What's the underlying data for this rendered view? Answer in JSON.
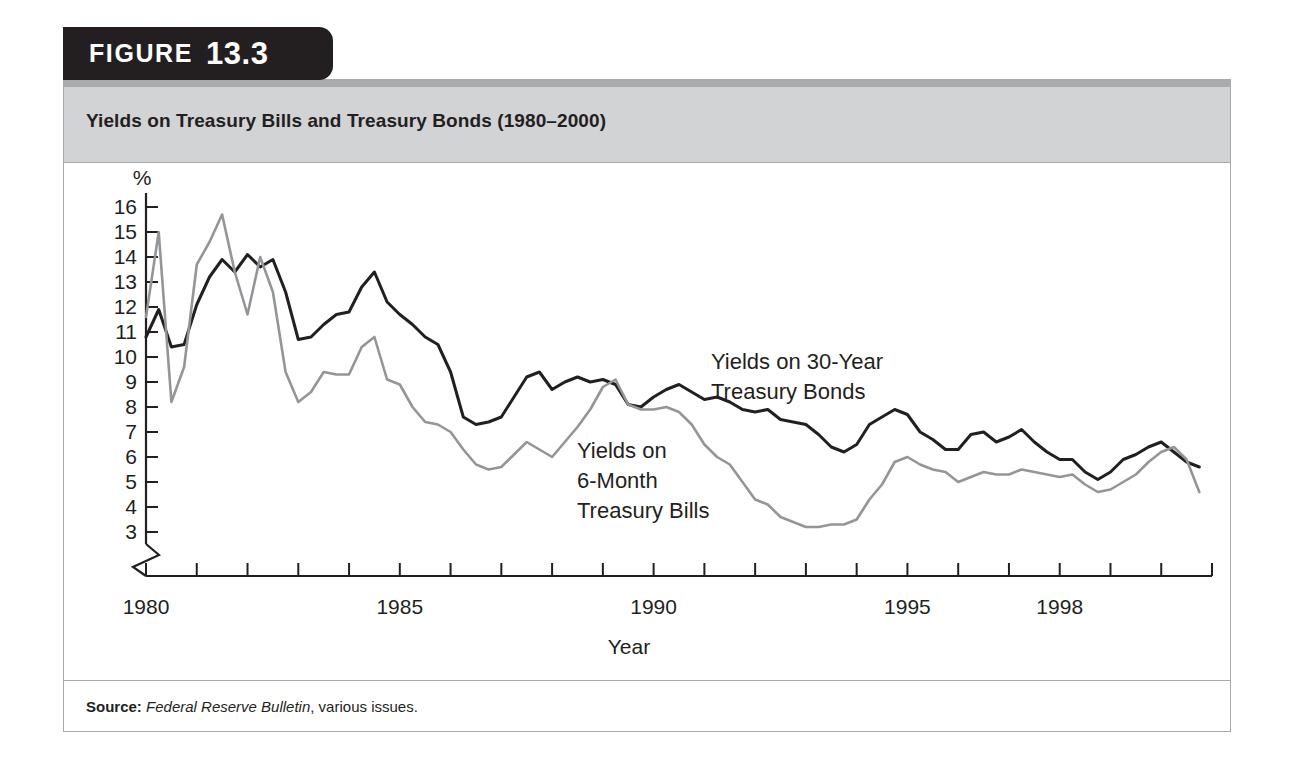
{
  "figure": {
    "badge_word": "FIGURE",
    "badge_number": "13.3",
    "title": "Yields on Treasury Bills and Treasury Bonds (1980–2000)",
    "source_label": "Source:",
    "source_italic": "Federal Reserve Bulletin",
    "source_rest": ", various issues."
  },
  "colors": {
    "badge_bg": "#231f20",
    "title_bg": "#d2d3d5",
    "frame_border": "#a7a9ac",
    "bonds_line": "#231f20",
    "bills_line": "#939598",
    "plot_bg": "#ffffff"
  },
  "annotations": {
    "bonds_line1": "Yields on 30-Year",
    "bonds_line2": "Treasury Bonds",
    "bills_line1": "Yields on",
    "bills_line2": "6-Month",
    "bills_line3": "Treasury Bills"
  },
  "chart_data": {
    "type": "line",
    "title": "Yields on Treasury Bills and Treasury Bonds (1980–2000)",
    "xlabel": "Year",
    "ylabel": "%",
    "xlim": [
      1980,
      2001
    ],
    "ylim": [
      3,
      16
    ],
    "grid": false,
    "legend_position": "inline-annotation",
    "y_ticks": [
      16,
      15,
      14,
      13,
      12,
      11,
      10,
      9,
      8,
      7,
      6,
      5,
      4,
      3
    ],
    "y_tick_labels": [
      "16",
      "15",
      "14",
      "13",
      "12",
      "11",
      "10",
      "9",
      "8",
      "7",
      "6",
      "5",
      "4",
      "3"
    ],
    "y_axis_break": true,
    "x_ticks": [
      1980,
      1981,
      1982,
      1983,
      1984,
      1985,
      1986,
      1987,
      1988,
      1989,
      1990,
      1991,
      1992,
      1993,
      1994,
      1995,
      1996,
      1997,
      1998,
      1999,
      2000,
      2001
    ],
    "x_tick_labels_shown": [
      "1980",
      "1985",
      "1990",
      "1995",
      "1998"
    ],
    "x_labeled_values": [
      1980,
      1985,
      1990,
      1995,
      1998
    ],
    "series": [
      {
        "name": "Yields on 30-Year Treasury Bonds",
        "color": "#231f20",
        "x": [
          1980.0,
          1980.25,
          1980.5,
          1980.75,
          1981.0,
          1981.25,
          1981.5,
          1981.75,
          1982.0,
          1982.25,
          1982.5,
          1982.75,
          1983.0,
          1983.25,
          1983.5,
          1983.75,
          1984.0,
          1984.25,
          1984.5,
          1984.75,
          1985.0,
          1985.25,
          1985.5,
          1985.75,
          1986.0,
          1986.25,
          1986.5,
          1986.75,
          1987.0,
          1987.25,
          1987.5,
          1987.75,
          1988.0,
          1988.25,
          1988.5,
          1988.75,
          1989.0,
          1989.25,
          1989.5,
          1989.75,
          1990.0,
          1990.25,
          1990.5,
          1990.75,
          1991.0,
          1991.25,
          1991.5,
          1991.75,
          1992.0,
          1992.25,
          1992.5,
          1992.75,
          1993.0,
          1993.25,
          1993.5,
          1993.75,
          1994.0,
          1994.25,
          1994.5,
          1994.75,
          1995.0,
          1995.25,
          1995.5,
          1995.75,
          1996.0,
          1996.25,
          1996.5,
          1996.75,
          1997.0,
          1997.25,
          1997.5,
          1997.75,
          1998.0,
          1998.25,
          1998.5,
          1998.75,
          1999.0,
          1999.25,
          1999.5,
          1999.75,
          2000.0,
          2000.25,
          2000.5,
          2000.75
        ],
        "y": [
          10.8,
          11.9,
          10.4,
          10.5,
          12.1,
          13.2,
          13.9,
          13.4,
          14.1,
          13.6,
          13.9,
          12.6,
          10.7,
          10.8,
          11.3,
          11.7,
          11.8,
          12.8,
          13.4,
          12.2,
          11.7,
          11.3,
          10.8,
          10.5,
          9.4,
          7.6,
          7.3,
          7.4,
          7.6,
          8.4,
          9.2,
          9.4,
          8.7,
          9.0,
          9.2,
          9.0,
          9.1,
          8.9,
          8.1,
          8.0,
          8.4,
          8.7,
          8.9,
          8.6,
          8.3,
          8.4,
          8.2,
          7.9,
          7.8,
          7.9,
          7.5,
          7.4,
          7.3,
          6.9,
          6.4,
          6.2,
          6.5,
          7.3,
          7.6,
          7.9,
          7.7,
          7.0,
          6.7,
          6.3,
          6.3,
          6.9,
          7.0,
          6.6,
          6.8,
          7.1,
          6.6,
          6.2,
          5.9,
          5.9,
          5.4,
          5.1,
          5.4,
          5.9,
          6.1,
          6.4,
          6.6,
          6.2,
          5.8,
          5.6
        ]
      },
      {
        "name": "Yields on 6-Month Treasury Bills",
        "color": "#939598",
        "x": [
          1980.0,
          1980.25,
          1980.5,
          1980.75,
          1981.0,
          1981.25,
          1981.5,
          1981.75,
          1982.0,
          1982.25,
          1982.5,
          1982.75,
          1983.0,
          1983.25,
          1983.5,
          1983.75,
          1984.0,
          1984.25,
          1984.5,
          1984.75,
          1985.0,
          1985.25,
          1985.5,
          1985.75,
          1986.0,
          1986.25,
          1986.5,
          1986.75,
          1987.0,
          1987.25,
          1987.5,
          1987.75,
          1988.0,
          1988.25,
          1988.5,
          1988.75,
          1989.0,
          1989.25,
          1989.5,
          1989.75,
          1990.0,
          1990.25,
          1990.5,
          1990.75,
          1991.0,
          1991.25,
          1991.5,
          1991.75,
          1992.0,
          1992.25,
          1992.5,
          1992.75,
          1993.0,
          1993.25,
          1993.5,
          1993.75,
          1994.0,
          1994.25,
          1994.5,
          1994.75,
          1995.0,
          1995.25,
          1995.5,
          1995.75,
          1996.0,
          1996.25,
          1996.5,
          1996.75,
          1997.0,
          1997.25,
          1997.5,
          1997.75,
          1998.0,
          1998.25,
          1998.5,
          1998.75,
          1999.0,
          1999.25,
          1999.5,
          1999.75,
          2000.0,
          2000.25,
          2000.5,
          2000.75
        ],
        "y": [
          11.6,
          15.0,
          8.2,
          9.6,
          13.7,
          14.6,
          15.7,
          13.4,
          11.7,
          14.0,
          12.6,
          9.4,
          8.2,
          8.6,
          9.4,
          9.3,
          9.3,
          10.4,
          10.8,
          9.1,
          8.9,
          8.0,
          7.4,
          7.3,
          7.0,
          6.3,
          5.7,
          5.5,
          5.6,
          6.1,
          6.6,
          6.3,
          6.0,
          6.6,
          7.2,
          7.9,
          8.8,
          9.1,
          8.1,
          7.9,
          7.9,
          8.0,
          7.8,
          7.3,
          6.5,
          6.0,
          5.7,
          5.0,
          4.3,
          4.1,
          3.6,
          3.4,
          3.2,
          3.2,
          3.3,
          3.3,
          3.5,
          4.3,
          4.9,
          5.8,
          6.0,
          5.7,
          5.5,
          5.4,
          5.0,
          5.2,
          5.4,
          5.3,
          5.3,
          5.5,
          5.4,
          5.3,
          5.2,
          5.3,
          4.9,
          4.6,
          4.7,
          5.0,
          5.3,
          5.8,
          6.2,
          6.4,
          5.9,
          4.6
        ]
      }
    ]
  }
}
